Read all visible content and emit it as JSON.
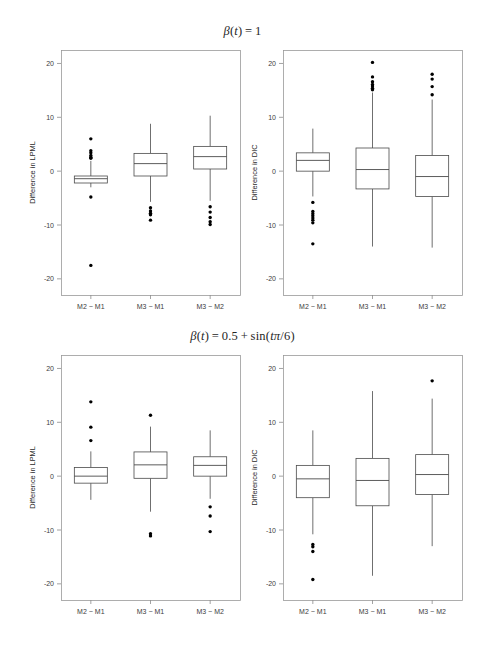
{
  "figure": {
    "width": 485,
    "height": 653,
    "background": "#ffffff",
    "foreground": "#1a1a1a"
  },
  "titles": {
    "top": "β(t) = 1",
    "bottom": "β(t) = 0.5 + sin(tπ/6)"
  },
  "axis": {
    "y_ticks": [
      "20",
      "10",
      "0",
      "-10",
      "-20"
    ],
    "y_tick_values": [
      20,
      10,
      0,
      -10,
      -20
    ],
    "x_categories": [
      "M2 − M1",
      "M3 − M1",
      "M3 − M2"
    ],
    "ylim": [
      -23,
      22.5
    ]
  },
  "chart_data": [
    {
      "type": "box",
      "panel": "top-left",
      "title": "β(t) = 1",
      "ylabel": "Difference in LPML",
      "xlabel": "",
      "categories": [
        "M2 − M1",
        "M3 − M1",
        "M3 − M2"
      ],
      "ylim": [
        -23,
        22.5
      ],
      "yticks": [
        20,
        10,
        0,
        -10,
        -20
      ],
      "grid": false,
      "boxes": [
        {
          "name": "M2 − M1",
          "whisker_low": -3.0,
          "q1": -2.2,
          "median": -1.4,
          "q3": -0.9,
          "whisker_high": 1.9,
          "outliers": [
            6.0,
            3.8,
            3.4,
            2.9,
            2.6,
            2.4,
            -4.8,
            -17.5
          ]
        },
        {
          "name": "M3 − M1",
          "whisker_low": -5.7,
          "q1": -0.9,
          "median": 1.4,
          "q3": 3.3,
          "whisker_high": 8.8,
          "outliers": [
            -6.8,
            -7.4,
            -7.8,
            -8.1,
            -9.1
          ]
        },
        {
          "name": "M3 − M2",
          "whisker_low": -5.5,
          "q1": 0.4,
          "median": 2.7,
          "q3": 4.6,
          "whisker_high": 10.3,
          "outliers": [
            -6.6,
            -7.6,
            -8.6,
            -9.4,
            -9.9
          ]
        }
      ]
    },
    {
      "type": "box",
      "panel": "top-right",
      "title": "β(t) = 1",
      "ylabel": "Difference in DIC",
      "xlabel": "",
      "categories": [
        "M2 − M1",
        "M3 − M1",
        "M3 − M2"
      ],
      "ylim": [
        -23,
        22.5
      ],
      "yticks": [
        20,
        10,
        0,
        -10,
        -20
      ],
      "grid": false,
      "boxes": [
        {
          "name": "M2 − M1",
          "whisker_low": -4.7,
          "q1": 0.0,
          "median": 2.0,
          "q3": 3.4,
          "whisker_high": 7.9,
          "outliers": [
            -5.8,
            -7.5,
            -7.9,
            -8.3,
            -8.7,
            -9.1,
            -9.6,
            -13.5
          ]
        },
        {
          "name": "M3 − M1",
          "whisker_low": -14.0,
          "q1": -3.3,
          "median": 0.3,
          "q3": 4.3,
          "whisker_high": 14.6,
          "outliers": [
            20.2,
            17.5,
            16.6,
            16.1,
            15.8,
            15.4,
            15.1
          ]
        },
        {
          "name": "M3 − M2",
          "whisker_low": -14.2,
          "q1": -4.7,
          "median": -1.0,
          "q3": 2.9,
          "whisker_high": 13.3,
          "outliers": [
            18.0,
            17.1,
            15.7,
            14.2
          ]
        }
      ]
    },
    {
      "type": "box",
      "panel": "bottom-left",
      "title": "β(t) = 0.5 + sin(tπ/6)",
      "ylabel": "Difference in LPML",
      "xlabel": "",
      "categories": [
        "M2 − M1",
        "M3 − M1",
        "M3 − M2"
      ],
      "ylim": [
        -23,
        22.5
      ],
      "yticks": [
        20,
        10,
        0,
        -10,
        -20
      ],
      "grid": false,
      "boxes": [
        {
          "name": "M2 − M1",
          "whisker_low": -4.4,
          "q1": -1.3,
          "median": 0.0,
          "q3": 1.6,
          "whisker_high": 4.6,
          "outliers": [
            13.8,
            9.1,
            6.6
          ]
        },
        {
          "name": "M3 − M1",
          "whisker_low": -6.6,
          "q1": -0.4,
          "median": 2.1,
          "q3": 4.5,
          "whisker_high": 9.2,
          "outliers": [
            11.3,
            -10.7,
            -11.1
          ]
        },
        {
          "name": "M3 − M2",
          "whisker_low": -4.2,
          "q1": 0.0,
          "median": 2.0,
          "q3": 3.6,
          "whisker_high": 8.5,
          "outliers": [
            -5.7,
            -7.4,
            -10.3
          ]
        }
      ]
    },
    {
      "type": "box",
      "panel": "bottom-right",
      "title": "β(t) = 0.5 + sin(tπ/6)",
      "ylabel": "Difference in DIC",
      "xlabel": "",
      "categories": [
        "M2 − M1",
        "M3 − M1",
        "M3 − M2"
      ],
      "ylim": [
        -23,
        22.5
      ],
      "yticks": [
        20,
        10,
        0,
        -10,
        -20
      ],
      "grid": false,
      "boxes": [
        {
          "name": "M2 − M1",
          "whisker_low": -10.8,
          "q1": -4.0,
          "median": -0.5,
          "q3": 2.0,
          "whisker_high": 8.5,
          "outliers": [
            -12.7,
            -13.1,
            -14.0,
            -19.2
          ]
        },
        {
          "name": "M3 − M1",
          "whisker_low": -18.5,
          "q1": -5.5,
          "median": -0.8,
          "q3": 3.3,
          "whisker_high": 15.8,
          "outliers": []
        },
        {
          "name": "M3 − M2",
          "whisker_low": -13.0,
          "q1": -3.4,
          "median": 0.3,
          "q3": 4.0,
          "whisker_high": 14.4,
          "outliers": [
            17.7
          ]
        }
      ]
    }
  ],
  "panel_geometry": [
    {
      "key": "top-left",
      "x": 61,
      "y": 50,
      "w": 179,
      "h": 245
    },
    {
      "key": "top-right",
      "x": 283,
      "y": 50,
      "w": 179,
      "h": 245
    },
    {
      "key": "bottom-left",
      "x": 61,
      "y": 355,
      "w": 179,
      "h": 245
    },
    {
      "key": "bottom-right",
      "x": 283,
      "y": 355,
      "w": 179,
      "h": 245
    }
  ]
}
